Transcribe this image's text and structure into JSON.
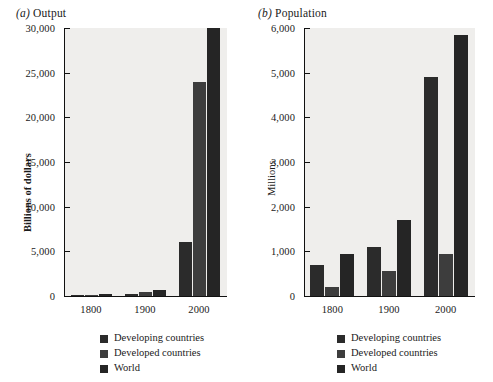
{
  "figure": {
    "background": "#ffffff",
    "plot_background": "#efeeec",
    "axis_color": "#111111"
  },
  "panels": [
    {
      "key": "output",
      "label": "(a)",
      "title": "Output",
      "ylabel": "Billions of dollars",
      "ylabel_bold": true,
      "yticks": [
        "0",
        "5,000",
        "10,000",
        "15,000",
        "20,000",
        "25,000",
        "30,000"
      ],
      "xticks": [
        "1800",
        "1900",
        "2000"
      ]
    },
    {
      "key": "population",
      "label": "(b)",
      "title": "Population",
      "ylabel": "Millions",
      "ylabel_bold": false,
      "yticks": [
        "0",
        "1,000",
        "2,000",
        "3,000",
        "4,000",
        "5,000",
        "6,000"
      ],
      "xticks": [
        "1800",
        "1900",
        "2000"
      ]
    }
  ],
  "legend": {
    "items": [
      {
        "label": "Developing countries",
        "color": "#2b2b2b",
        "class": "c-developing"
      },
      {
        "label": "Developed countries",
        "color": "#3d3d3d",
        "class": "c-developed"
      },
      {
        "label": "World",
        "color": "#252525",
        "class": "c-world"
      }
    ]
  },
  "chart_data": [
    {
      "type": "bar",
      "panel": "(a) Output",
      "title": "Output",
      "xlabel": "",
      "ylabel": "Billions of dollars",
      "categories": [
        "1800",
        "1900",
        "2000"
      ],
      "series": [
        {
          "name": "Developing countries",
          "color": "#2b2b2b",
          "values": [
            100,
            200,
            6000
          ]
        },
        {
          "name": "Developed countries",
          "color": "#3d3d3d",
          "values": [
            90,
            500,
            24000
          ]
        },
        {
          "name": "World",
          "color": "#252525",
          "values": [
            190,
            700,
            30000
          ]
        }
      ],
      "ylim": [
        0,
        30000
      ],
      "ytick_values": [
        0,
        5000,
        10000,
        15000,
        20000,
        25000,
        30000
      ],
      "grid": false,
      "legend_position": "bottom"
    },
    {
      "type": "bar",
      "panel": "(b) Population",
      "title": "Population",
      "xlabel": "",
      "ylabel": "Millions",
      "categories": [
        "1800",
        "1900",
        "2000"
      ],
      "series": [
        {
          "name": "Developing countries",
          "color": "#2b2b2b",
          "values": [
            700,
            1100,
            4900
          ]
        },
        {
          "name": "Developed countries",
          "color": "#3d3d3d",
          "values": [
            210,
            550,
            950
          ]
        },
        {
          "name": "World",
          "color": "#252525",
          "values": [
            950,
            1700,
            5850
          ]
        }
      ],
      "ylim": [
        0,
        6000
      ],
      "ytick_values": [
        0,
        1000,
        2000,
        3000,
        4000,
        5000,
        6000
      ],
      "grid": false,
      "legend_position": "bottom"
    }
  ]
}
